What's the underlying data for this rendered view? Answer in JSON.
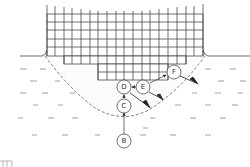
{
  "diagram": {
    "type": "soil-root-zone-cross-section",
    "colors": {
      "line": "#333333",
      "background": "#ffffff",
      "stipple": "#999999"
    },
    "nodes": [
      {
        "id": "B",
        "label": "B",
        "x": 124,
        "y": 141
      },
      {
        "id": "C",
        "label": "C",
        "x": 124,
        "y": 105
      },
      {
        "id": "D",
        "label": "D",
        "x": 124,
        "y": 87
      },
      {
        "id": "E",
        "label": "E",
        "x": 143,
        "y": 87
      },
      {
        "id": "F",
        "label": "F",
        "x": 174,
        "y": 72
      }
    ],
    "edges": [
      {
        "from": "B",
        "to": "C"
      },
      {
        "from": "C",
        "to": "D"
      },
      {
        "from": "E",
        "to": "D"
      },
      {
        "from": "E",
        "to": "F"
      }
    ],
    "outflows": [
      {
        "from": "D",
        "direction": "down-right"
      },
      {
        "from": "E",
        "direction": "down-right"
      },
      {
        "from": "F",
        "direction": "down-right"
      }
    ],
    "regions": {
      "grid": "mesh structure above and within ground",
      "stippled_zone": "bowl-shaped zone beneath structure",
      "water_dashes": "surrounding medium"
    }
  }
}
